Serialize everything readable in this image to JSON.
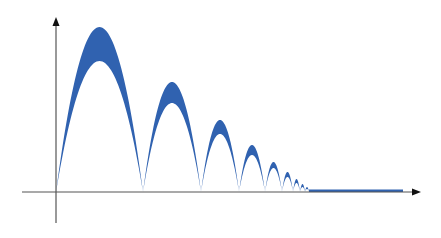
{
  "chart_data": {
    "type": "area",
    "title": "",
    "xlabel": "",
    "ylabel": "",
    "grid": false,
    "legend": null,
    "band_color": "#3062b0",
    "axis_color": "#555555",
    "baseline_px": 192,
    "origin_px": [
      56,
      192
    ],
    "x_axis_px": {
      "start": 22,
      "end": 421
    },
    "y_axis_px": {
      "top": 17,
      "bottom": 223
    },
    "arches": [
      {
        "x_start": 56,
        "x_end": 143,
        "outer_height": 165,
        "inner_height": 131
      },
      {
        "x_start": 143,
        "x_end": 201,
        "outer_height": 110,
        "inner_height": 89
      },
      {
        "x_start": 201,
        "x_end": 239,
        "outer_height": 72,
        "inner_height": 58
      },
      {
        "x_start": 239,
        "x_end": 265,
        "outer_height": 47,
        "inner_height": 37
      },
      {
        "x_start": 265,
        "x_end": 282,
        "outer_height": 30,
        "inner_height": 24
      },
      {
        "x_start": 282,
        "x_end": 293,
        "outer_height": 20,
        "inner_height": 15
      },
      {
        "x_start": 293,
        "x_end": 300,
        "outer_height": 13,
        "inner_height": 9
      },
      {
        "x_start": 300,
        "x_end": 305,
        "outer_height": 8,
        "inner_height": 5
      },
      {
        "x_start": 305,
        "x_end": 309,
        "outer_height": 5,
        "inner_height": 3
      }
    ],
    "flat_band": {
      "x_start": 309,
      "x_end": 403,
      "thickness": 2.5
    }
  }
}
